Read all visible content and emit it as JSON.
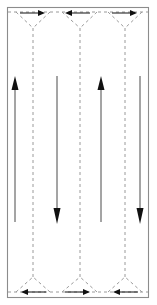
{
  "figure": {
    "width": 157,
    "height": 305,
    "background_color": "#ffffff"
  },
  "colors": {
    "solid_stroke": "#4a4a4a",
    "dashed_stroke": "#9a9a9a",
    "boundary_stroke": "#8c8c8c",
    "arrow_fill": "#111111",
    "connector_stroke": "#111111"
  },
  "boundary": {
    "name": "region-boundary",
    "style": "solid",
    "x": 7,
    "y": 7,
    "width": 142,
    "height": 291
  },
  "sweep_lanes": [
    {
      "id": "lane-1",
      "x": 15,
      "y_top": 78,
      "y_bottom": 222,
      "direction": "up",
      "arrow_at": "top"
    },
    {
      "id": "lane-2",
      "x": 57,
      "y_top": 78,
      "y_bottom": 222,
      "direction": "down",
      "arrow_at": "bottom"
    },
    {
      "id": "lane-3",
      "x": 101,
      "y_top": 78,
      "y_bottom": 222,
      "direction": "up",
      "arrow_at": "top"
    },
    {
      "id": "lane-4",
      "x": 140,
      "y_top": 78,
      "y_bottom": 222,
      "direction": "down",
      "arrow_at": "bottom"
    }
  ],
  "transition_lines": [
    {
      "id": "dashed-column-1",
      "x": 33,
      "y_top": 28,
      "y_bottom": 277,
      "style": "dashed"
    },
    {
      "id": "dashed-column-2",
      "x": 80,
      "y_top": 28,
      "y_bottom": 277,
      "style": "dashed"
    },
    {
      "id": "dashed-column-3",
      "x": 125,
      "y_top": 28,
      "y_bottom": 277,
      "style": "dashed"
    }
  ],
  "top_edge": {
    "y": 12,
    "style": "dashed",
    "vertices": [
      {
        "id": "top-v-1",
        "apex_x": 33,
        "apex_y": 28
      },
      {
        "id": "top-v-2",
        "apex_x": 80,
        "apex_y": 28
      },
      {
        "id": "top-v-3",
        "apex_x": 125,
        "apex_y": 28
      }
    ],
    "arrows": [
      {
        "id": "top-arrow-1",
        "direction": "right",
        "x_start": 20,
        "x_end": 45,
        "y": 13
      },
      {
        "id": "top-arrow-2",
        "direction": "left",
        "x_start": 90,
        "x_end": 65,
        "y": 13
      },
      {
        "id": "top-arrow-3",
        "direction": "right",
        "x_start": 112,
        "x_end": 137,
        "y": 13
      }
    ]
  },
  "bottom_edge": {
    "y": 292,
    "style": "dashed",
    "vertices": [
      {
        "id": "bottom-v-1",
        "apex_x": 33,
        "apex_y": 277
      },
      {
        "id": "bottom-v-2",
        "apex_x": 80,
        "apex_y": 277
      },
      {
        "id": "bottom-v-3",
        "apex_x": 125,
        "apex_y": 277
      }
    ],
    "arrows": [
      {
        "id": "bottom-arrow-1",
        "direction": "left",
        "x_start": 46,
        "x_end": 21,
        "y": 292
      },
      {
        "id": "bottom-arrow-2",
        "direction": "right",
        "x_start": 65,
        "x_end": 90,
        "y": 292
      },
      {
        "id": "bottom-arrow-3",
        "direction": "left",
        "x_start": 138,
        "x_end": 113,
        "y": 292
      }
    ]
  },
  "labels": {
    "caption": ""
  }
}
